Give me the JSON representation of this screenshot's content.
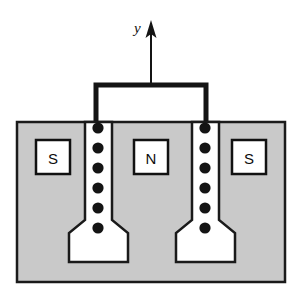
{
  "figure": {
    "axis": {
      "label": "y",
      "direction": "up",
      "icon": "up-arrow-icon"
    },
    "poles": [
      {
        "id": "left-pole",
        "label": "S"
      },
      {
        "id": "center-pole",
        "label": "N"
      },
      {
        "id": "right-pole",
        "label": "S"
      }
    ],
    "coils": [
      {
        "id": "left-coil",
        "dot_count": 6,
        "dot_cx": 98,
        "dot_cys": [
          128,
          148,
          168,
          188,
          208,
          228
        ]
      },
      {
        "id": "right-coil",
        "dot_count": 6,
        "dot_cx": 205,
        "dot_cys": [
          128,
          148,
          168,
          188,
          208,
          228
        ]
      }
    ],
    "colors": {
      "yoke_fill": "#c9c9c9",
      "gap_fill": "#ffffff",
      "stroke": "#1a1a1a",
      "dot_fill": "#141414",
      "label_box_fill": "#ffffff",
      "background": "#ffffff"
    },
    "geometry": {
      "body_x": 17,
      "body_y": 122,
      "body_width": 268,
      "body_height": 160,
      "bracket_left_x": 96,
      "bracket_right_x": 206,
      "bracket_top_y": 84,
      "bracket_bottom_y": 122,
      "arrow_x": 151,
      "arrow_tip_y": 22,
      "arrow_base_y": 84
    }
  }
}
